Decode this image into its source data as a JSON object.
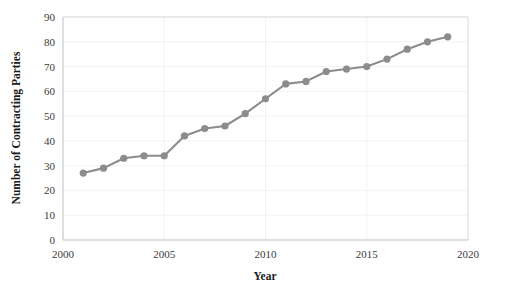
{
  "chart_data": {
    "type": "line",
    "title": "",
    "subtitle": "",
    "xlabel": "Year",
    "ylabel": "Number of Contracting Parties",
    "xlim": [
      2000,
      2020
    ],
    "ylim": [
      0,
      90
    ],
    "xticks": [
      2000,
      2005,
      2010,
      2015,
      2020
    ],
    "yticks": [
      0,
      10,
      20,
      30,
      40,
      50,
      60,
      70,
      80,
      90
    ],
    "grid": true,
    "grid_axis": "y",
    "legend": false,
    "legend_position": "none",
    "marker": "circle",
    "series_color": "#8c8c8c",
    "x": [
      2001,
      2002,
      2003,
      2004,
      2005,
      2006,
      2007,
      2008,
      2009,
      2010,
      2011,
      2012,
      2013,
      2014,
      2015,
      2016,
      2017,
      2018,
      2019
    ],
    "values": [
      27,
      29,
      33,
      34,
      34,
      42,
      45,
      46,
      51,
      57,
      63,
      64,
      68,
      69,
      70,
      73,
      77,
      80,
      82
    ],
    "series": [
      {
        "name": "Number of Contracting Parties",
        "values": [
          27,
          29,
          33,
          34,
          34,
          42,
          45,
          46,
          51,
          57,
          63,
          64,
          68,
          69,
          70,
          73,
          77,
          80,
          82
        ]
      }
    ],
    "annotations": []
  },
  "axis_tick_labels": {
    "y": [
      "90",
      "80",
      "70",
      "60",
      "50",
      "40",
      "30",
      "20",
      "10",
      "0"
    ],
    "x": [
      "2000",
      "2005",
      "2010",
      "2015",
      "2020"
    ]
  },
  "colors": {
    "series": "#8c8c8c",
    "grid": "#f2f2f2",
    "frame": "#d9d9d9",
    "axis": "#bfbfbf",
    "text": "#1a1a1a",
    "tick_text": "#3a3a3a",
    "background": "#ffffff"
  }
}
